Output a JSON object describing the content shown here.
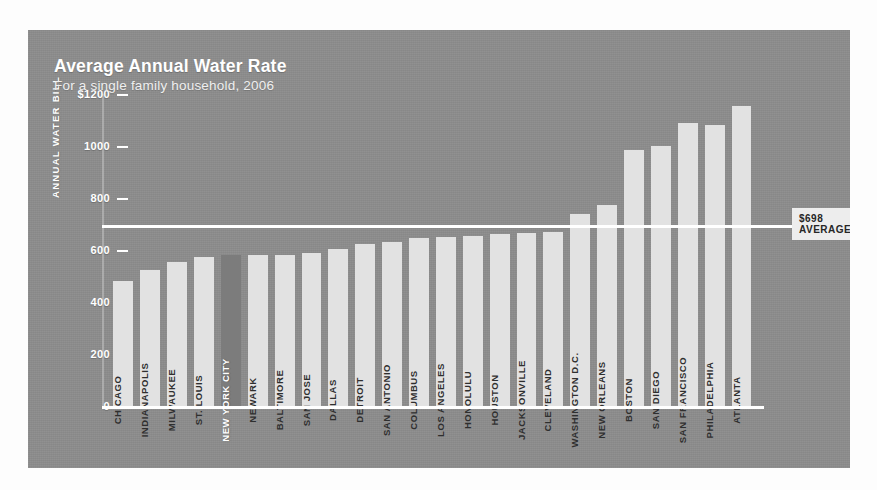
{
  "chart_data": {
    "type": "bar",
    "title": "Average Annual Water Rate",
    "subtitle": "For a single family household, 2006",
    "xlabel": "",
    "ylabel": "ANNUAL WATER BILL",
    "ylim": [
      0,
      1200
    ],
    "yticks": [
      "$1200",
      "1000",
      "800",
      "600",
      "400",
      "200",
      "0"
    ],
    "ytick_values": [
      1200,
      1000,
      800,
      600,
      400,
      200,
      0
    ],
    "grid": false,
    "legend": "none",
    "source": "Source: NYC Water Board",
    "highlight_category": "NEW YORK CITY",
    "average": {
      "value": 698,
      "label_value": "$698",
      "label_text": "AVERAGE"
    },
    "categories": [
      "CHICAGO",
      "INDIANAPOLIS",
      "MILWAUKEE",
      "ST. LOUIS",
      "NEW YORK CITY",
      "NEWARK",
      "BALTIMORE",
      "SAN JOSE",
      "DALLAS",
      "DETROIT",
      "SAN ANTONIO",
      "COLUMBUS",
      "LOS ANGELES",
      "HONOLULU",
      "HOUSTON",
      "JACKSONVILLE",
      "CLEVELAND",
      "WASHINGTON D.C.",
      "NEW ORLEANS",
      "BOSTON",
      "SAN DIEGO",
      "SAN FRANCISCO",
      "PHILADELPHIA",
      "ATLANTA"
    ],
    "values": [
      480,
      525,
      555,
      575,
      580,
      580,
      580,
      590,
      605,
      625,
      630,
      645,
      650,
      655,
      660,
      665,
      670,
      740,
      775,
      985,
      1000,
      1090,
      1080,
      1155
    ]
  },
  "panel": {
    "background_color": "#8d8d8d",
    "bar_color": "#e2e2e2",
    "highlight_bar_color": "#7c7c7c",
    "axis_color": "#ffffff"
  }
}
